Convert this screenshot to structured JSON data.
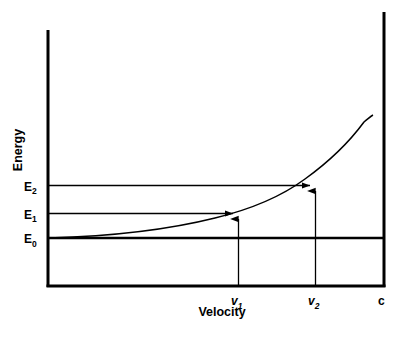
{
  "figure": {
    "title": "",
    "background_color": "#ffffff",
    "line_color": "#000000"
  },
  "axes": {
    "y_axis_label": "Energy",
    "x_axis_label": "Velocity",
    "y_ticks": [
      {
        "label": "E",
        "subscript": "0",
        "value": 0
      },
      {
        "label": "E",
        "subscript": "1",
        "value": 1
      },
      {
        "label": "E",
        "subscript": "2",
        "value": 2
      }
    ],
    "x_ticks": [
      {
        "label": "v",
        "subscript": "1",
        "italic": true
      },
      {
        "label": "v",
        "subscript": "2",
        "italic": true
      },
      {
        "label": "c",
        "subscript": "",
        "italic": false
      }
    ]
  },
  "chart_data": {
    "type": "line",
    "title": "",
    "xlabel": "Velocity",
    "ylabel": "Energy",
    "xlim": [
      0,
      1
    ],
    "ylim": [
      0,
      1
    ],
    "grid": false,
    "legend": null,
    "series": [
      {
        "name": "Relativistic energy E(v)",
        "x": [
          0.0,
          0.05,
          0.1,
          0.15,
          0.2,
          0.25,
          0.3,
          0.35,
          0.4,
          0.45,
          0.5,
          0.55,
          0.6,
          0.65,
          0.7,
          0.75,
          0.8,
          0.85,
          0.9,
          0.93,
          0.95,
          0.965
        ],
        "y": [
          0.0,
          0.002,
          0.006,
          0.014,
          0.025,
          0.04,
          0.058,
          0.081,
          0.109,
          0.143,
          0.182,
          0.229,
          0.285,
          0.351,
          0.43,
          0.525,
          0.641,
          0.784,
          0.966,
          1.1,
          1.21,
          1.31
        ]
      }
    ],
    "annotations": [
      {
        "name": "E1 level line",
        "type": "horizontal_arrow",
        "y_value_label": "E1",
        "from_x": 0.0,
        "to_x": 0.565,
        "y": 0.455
      },
      {
        "name": "E2 level line",
        "type": "horizontal_arrow",
        "y_value_label": "E2",
        "from_x": 0.0,
        "to_x": 0.79,
        "y": 0.857
      },
      {
        "name": "v1 drop line",
        "type": "vertical_arrow",
        "x_value_label": "v1",
        "x": 0.565,
        "from_y": 0.0,
        "to_y": 0.455
      },
      {
        "name": "v2 drop line",
        "type": "vertical_arrow",
        "x_value_label": "v2",
        "x": 0.79,
        "from_y": 0.0,
        "to_y": 0.857
      },
      {
        "name": "E0 rest energy baseline",
        "type": "horizontal_line",
        "y_value_label": "E0",
        "from_x": 0.0,
        "to_x": 1.0,
        "y": 0.0
      },
      {
        "name": "c asymptote",
        "type": "vertical_line",
        "x_value_label": "c",
        "x": 1.0
      }
    ]
  }
}
